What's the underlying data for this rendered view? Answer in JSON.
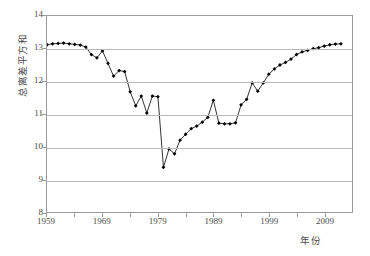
{
  "chart_data": {
    "type": "line",
    "title": "",
    "xlabel": "年份",
    "ylabel": "总离差平方和",
    "xlim": [
      1959,
      2014
    ],
    "ylim": [
      8,
      14
    ],
    "grid": true,
    "legend": null,
    "marker": "filled-diamond",
    "line_color": "#1a1a1a",
    "marker_color": "#000000",
    "grid_color": "#b9b9b9",
    "frame_color": "#9a9a9a",
    "ytick_labels": [
      "14",
      "13",
      "12",
      "11",
      "10",
      "9",
      "8"
    ],
    "ytick_values": [
      14,
      13,
      12,
      11,
      10,
      9,
      8
    ],
    "xtick_labels": [
      "1959",
      "1969",
      "1979",
      "1989",
      "1999",
      "2009"
    ],
    "xtick_values": [
      1959,
      1969,
      1979,
      1989,
      1999,
      2009
    ],
    "xtick_minor_values": [
      1964,
      1974,
      1984,
      1994,
      2004
    ],
    "x": [
      1959,
      1960,
      1961,
      1962,
      1963,
      1964,
      1965,
      1966,
      1967,
      1968,
      1969,
      1970,
      1971,
      1972,
      1973,
      1974,
      1975,
      1976,
      1977,
      1978,
      1979,
      1980,
      1981,
      1982,
      1983,
      1984,
      1985,
      1986,
      1987,
      1988,
      1989,
      1990,
      1991,
      1992,
      1993,
      1994,
      1995,
      1996,
      1997,
      1998,
      1999,
      2000,
      2001,
      2002,
      2003,
      2004,
      2005,
      2006,
      2007,
      2008,
      2009,
      2010,
      2011,
      2012
    ],
    "values": [
      13.12,
      13.15,
      13.16,
      13.17,
      13.15,
      13.13,
      13.11,
      13.05,
      12.82,
      12.72,
      12.93,
      12.55,
      12.16,
      12.33,
      12.3,
      11.68,
      11.25,
      11.55,
      11.03,
      11.55,
      11.53,
      9.37,
      9.93,
      9.78,
      10.2,
      10.38,
      10.55,
      10.63,
      10.75,
      10.9,
      11.42,
      10.72,
      10.7,
      10.7,
      10.73,
      11.28,
      11.45,
      11.95,
      11.7,
      11.95,
      12.22,
      12.38,
      12.5,
      12.58,
      12.68,
      12.82,
      12.9,
      12.95,
      13.0,
      13.03,
      13.08,
      13.12,
      13.14,
      13.15
    ]
  }
}
